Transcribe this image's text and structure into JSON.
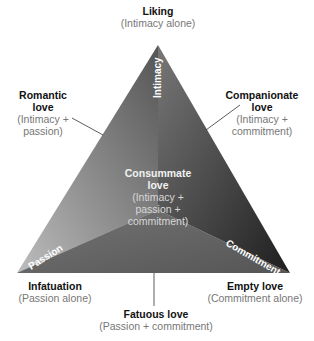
{
  "diagram": {
    "vertices": {
      "top": {
        "title": "Liking",
        "subtitle": "(Intimacy alone)"
      },
      "left": {
        "title": "Infatuation",
        "subtitle": "(Passion alone)"
      },
      "right": {
        "title": "Empty love",
        "subtitle": "(Commitment alone)"
      }
    },
    "sides": {
      "left": {
        "title_line1": "Romantic",
        "title_line2": "love",
        "sub_line1": "(Intimacy +",
        "sub_line2": "passion)"
      },
      "right": {
        "title_line1": "Companionate",
        "title_line2": "love",
        "sub_line1": "(Intimacy +",
        "sub_line2": "commitment)"
      },
      "bottom": {
        "title": "Fatuous love",
        "subtitle": "(Passion + commitment)"
      }
    },
    "center": {
      "title_line1": "Consummate",
      "title_line2": "love",
      "sub_line1": "(Intimacy +",
      "sub_line2": "passion +",
      "sub_line3": "commitment)"
    },
    "axis_labels": {
      "intimacy": "Intimacy",
      "passion": "Passion",
      "commitment": "Commitment"
    },
    "colors": {
      "dark": "#2a2a2a",
      "mid": "#6a6a6a",
      "light": "#b8b8b8",
      "text_light": "#ffffff"
    }
  }
}
